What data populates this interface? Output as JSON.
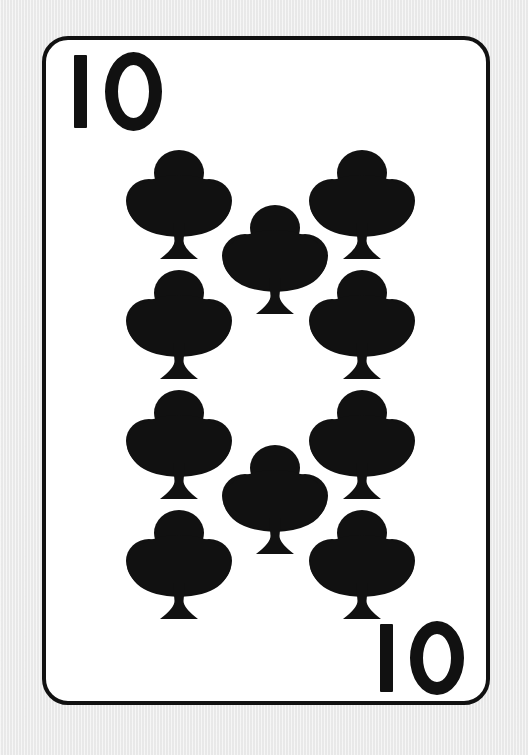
{
  "card": {
    "name": "Ten of Clubs",
    "rank": "10",
    "suit": "clubs",
    "suit_symbol": "♣",
    "pip_count": 10,
    "colors": {
      "background": "#ebebeb",
      "card_face": "#ffffff",
      "ink": "#111111",
      "border": "#111111"
    },
    "geometry": {
      "card_left": 42,
      "card_top": 36,
      "card_width": 448,
      "card_height": 669,
      "border_width": 4,
      "corner_radius": 26
    }
  },
  "indices": [
    {
      "id": "top-left",
      "position": "top-left",
      "rank_digit_one": "1",
      "rank_digit_zero": "0",
      "rank": "10",
      "rotated": false
    },
    {
      "id": "bottom-right",
      "position": "bottom-right",
      "rank_digit_one": "1",
      "rank_digit_zero": "0",
      "rank": "10",
      "rotated": false
    }
  ],
  "pips": [
    {
      "id": "pip-left-1",
      "column": "left",
      "row": 1,
      "x": 80,
      "y": 109,
      "orientation": "upright"
    },
    {
      "id": "pip-left-2",
      "column": "left",
      "row": 2,
      "x": 80,
      "y": 229,
      "orientation": "upright"
    },
    {
      "id": "pip-left-3",
      "column": "left",
      "row": 3,
      "x": 80,
      "y": 349,
      "orientation": "upright"
    },
    {
      "id": "pip-left-4",
      "column": "left",
      "row": 4,
      "x": 80,
      "y": 469,
      "orientation": "upright"
    },
    {
      "id": "pip-right-1",
      "column": "right",
      "row": 1,
      "x": 263,
      "y": 109,
      "orientation": "upright"
    },
    {
      "id": "pip-right-2",
      "column": "right",
      "row": 2,
      "x": 263,
      "y": 229,
      "orientation": "upright"
    },
    {
      "id": "pip-right-3",
      "column": "right",
      "row": 3,
      "x": 263,
      "y": 349,
      "orientation": "upright"
    },
    {
      "id": "pip-right-4",
      "column": "right",
      "row": 4,
      "x": 263,
      "y": 469,
      "orientation": "upright"
    },
    {
      "id": "pip-center-1",
      "column": "center",
      "row": 1,
      "x": 176,
      "y": 164,
      "orientation": "upright"
    },
    {
      "id": "pip-center-2",
      "column": "center",
      "row": 2,
      "x": 176,
      "y": 404,
      "orientation": "upright"
    }
  ]
}
